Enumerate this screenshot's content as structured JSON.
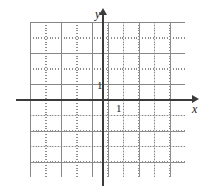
{
  "figure": {
    "name": "cartesian-coordinate-grid",
    "background_color": "#ffffff"
  },
  "axes": {
    "x_axis": {
      "label": "x",
      "color": "#3b3b3b",
      "arrow": "right"
    },
    "y_axis": {
      "label": "y",
      "color": "#3b3b3b",
      "arrow": "up"
    },
    "origin": {
      "x": 103,
      "y": 100
    }
  },
  "ticks": {
    "y_unit_label": "1",
    "x_unit_label": "1"
  },
  "grid": {
    "dot_color": "#7a7a7a",
    "major_line_color": "#969696",
    "cell_px": 15.5,
    "left": 30,
    "top": 22,
    "width": 155,
    "height": 155,
    "columns": 10,
    "rows": 10
  },
  "chart_data": {
    "type": "scatter",
    "title": "",
    "xlabel": "x",
    "ylabel": "y",
    "xlim": [
      -4.7,
      5.3
    ],
    "ylim": [
      -5,
      5
    ],
    "x": [],
    "y": [],
    "series": [],
    "grid": true,
    "grid_style": "dotted",
    "legend": "none",
    "annotations": [
      "1",
      "1"
    ],
    "xticks": [
      1
    ],
    "yticks": [
      1
    ],
    "xticklabels": [
      "1"
    ],
    "yticklabels": [
      "1"
    ],
    "note": "Empty Cartesian grid with labeled unit ticks on both axes; no plotted data."
  }
}
